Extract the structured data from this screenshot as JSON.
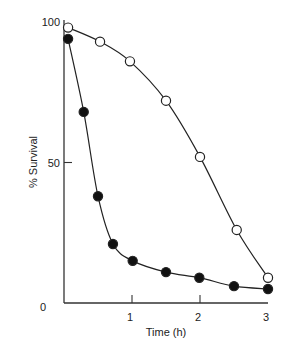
{
  "chart_data": {
    "type": "line",
    "title": "",
    "xlabel": "Time (h)",
    "ylabel": "% Survival",
    "xlim": [
      0,
      3
    ],
    "ylim": [
      0,
      100
    ],
    "x_ticks": [
      "1",
      "2",
      "3"
    ],
    "y_ticks": [
      "0",
      "50",
      "100"
    ],
    "grid": false,
    "legend": null,
    "series": [
      {
        "name": "open-circles",
        "marker": "open-circle",
        "x": [
          0.06,
          0.53,
          0.97,
          1.5,
          2.0,
          2.54,
          3.0
        ],
        "y": [
          98,
          93,
          86,
          72,
          52,
          26,
          9
        ]
      },
      {
        "name": "filled-circles",
        "marker": "filled-circle",
        "x": [
          0.06,
          0.29,
          0.5,
          0.72,
          1.01,
          1.5,
          1.99,
          2.5,
          3.0
        ],
        "y": [
          94,
          68,
          38,
          21,
          15,
          11,
          9,
          6,
          5
        ]
      }
    ]
  }
}
